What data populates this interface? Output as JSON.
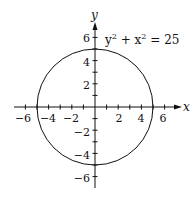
{
  "chart_data": {
    "type": "line",
    "title": "",
    "annotation": "y² + x² = 25",
    "equation": {
      "lhs_terms": [
        "y",
        "x"
      ],
      "exponent": "2",
      "rhs": "25"
    },
    "curve": "circle",
    "center": [
      0,
      0
    ],
    "radius": 5,
    "xlabel": "x",
    "ylabel": "y",
    "xlim": [
      -7,
      7
    ],
    "ylim": [
      -7,
      7
    ],
    "x_tick_labels": [
      "-6",
      "-4",
      "-2",
      "2",
      "4",
      "6"
    ],
    "y_tick_labels": [
      "6",
      "4",
      "2",
      "-2",
      "-4",
      "-6"
    ],
    "minor_ticks_every": 1,
    "grid": false,
    "legend": "none",
    "colors": {
      "curve": "#111111",
      "axes": "#111111"
    }
  }
}
